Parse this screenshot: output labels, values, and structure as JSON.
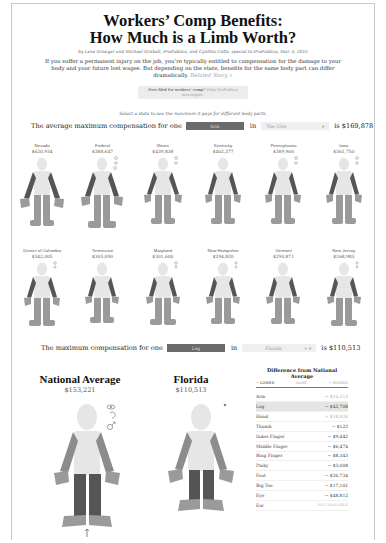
{
  "header": {
    "title_line1": "Workers’ Comp Benefits:",
    "title_line2": "How Much is a Limb Worth?",
    "byline": "by Lena Groeger and Michael Grabell, ProPublica, and Cynthia Cotts, special to ProPublica, Mar. 5, 2015",
    "intro": "If you suffer a permanent injury on the job, you’re typically entitled to compensation for the damage to your body and your future lost wages. But depending on the state, benefits for the same body part can differ dramatically.",
    "related_link": "Related Story »",
    "pill_text": "Ever filed for workers’ comp?",
    "pill_link": "Help ProPublica investigate.",
    "hint": "Select a state to see the maximum it pays for different body parts."
  },
  "selector1": {
    "prefix": "The average maximum compensation for one",
    "part": "Arm",
    "in_label": "in",
    "region": "The USA",
    "region_caret": "▾",
    "suffix": "is $169,878"
  },
  "states_row1": [
    {
      "name": "Nevada",
      "value": "$620,934"
    },
    {
      "name": "Federal",
      "value": "$388,647"
    },
    {
      "name": "Illinois",
      "value": "$439,838"
    },
    {
      "name": "Kentucky",
      "value": "$402,277"
    },
    {
      "name": "Pennsylvania",
      "value": "$389,900"
    },
    {
      "name": "Iowa",
      "value": "$361,750"
    }
  ],
  "states_row2": [
    {
      "name": "District of Columbia",
      "value": "$342,005"
    },
    {
      "name": "Tennessee",
      "value": "$305,090"
    },
    {
      "name": "Maryland",
      "value": "$301,600"
    },
    {
      "name": "New Hampshire",
      "value": "$294,820"
    },
    {
      "name": "Vermont",
      "value": "$290,871"
    },
    {
      "name": "New Jersey",
      "value": "$268,983"
    }
  ],
  "selector2": {
    "prefix": "The maximum compensation for one",
    "part": "Leg",
    "in_label": "in",
    "region": "Florida",
    "region_clear": "×",
    "region_caret": "▾",
    "suffix": "is $110,513"
  },
  "comparison": {
    "left": {
      "title": "National Average",
      "value": "$153,221"
    },
    "right": {
      "title": "Florida",
      "value": "$110,513"
    }
  },
  "difference": {
    "title": "Difference from National Average",
    "tabs": [
      "− LOWER",
      "SAME",
      "+ HIGHER"
    ],
    "rows": [
      {
        "part": "Arm",
        "amount": "+ $16,213"
      },
      {
        "part": "Leg",
        "amount": "− $42,708"
      },
      {
        "part": "Hand",
        "amount": "+ $18,026"
      },
      {
        "part": "Thumb",
        "amount": "− $122"
      },
      {
        "part": "Index Finger",
        "amount": "− $9,442"
      },
      {
        "part": "Middle Finger",
        "amount": "− $6,474"
      },
      {
        "part": "Ring Finger",
        "amount": "− $8,343"
      },
      {
        "part": "Pinky",
        "amount": "− $3,008"
      },
      {
        "part": "Foot",
        "amount": "− $26,734"
      },
      {
        "part": "Big Toe",
        "amount": "− $17,101"
      },
      {
        "part": "Eye",
        "amount": "− $48,812"
      },
      {
        "part": "Ear",
        "amount": "NOT AVAILABLE"
      }
    ]
  },
  "colors": {
    "highlight_dark": "#555555",
    "limb_mid": "#9a9a9a",
    "body_light": "#e6e6e6"
  }
}
